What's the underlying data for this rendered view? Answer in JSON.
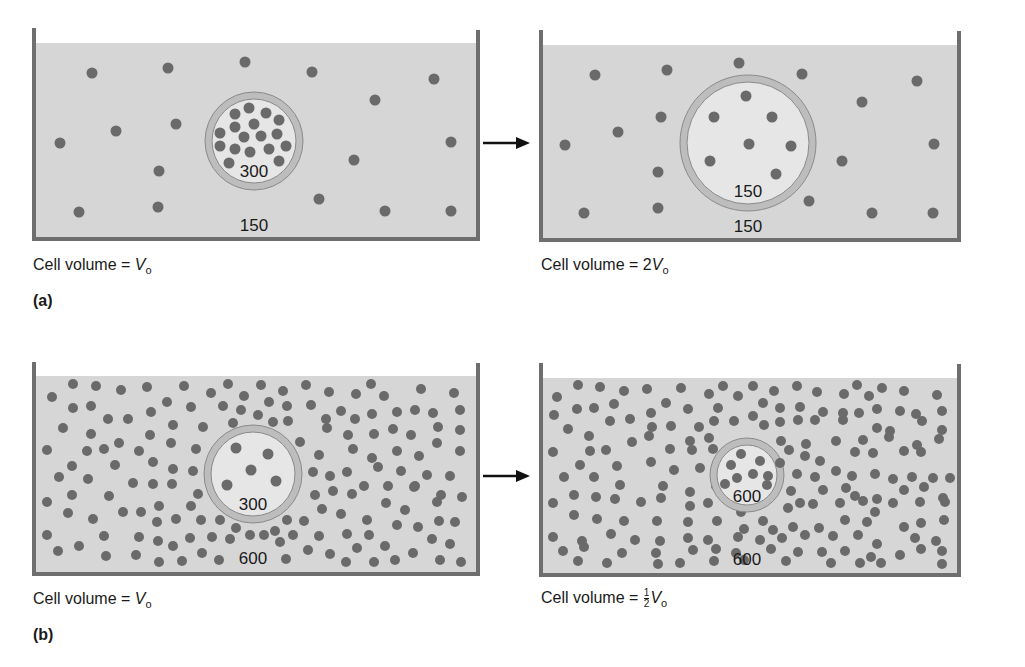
{
  "colors": {
    "fluid": "#d6d6d6",
    "container_wall": "#6e6e6e",
    "particle": "#6a6a6a",
    "cell_interior": "#e6e6e6",
    "cell_membrane": "#bdbdbd",
    "membrane_outline": "#8a8a8a",
    "arrow": "#111111"
  },
  "figure": {
    "panels": [
      {
        "id": "a",
        "label": "(a)",
        "before": {
          "caption_prefix": "Cell volume = ",
          "caption_coeff": "",
          "caption_var": "V",
          "caption_sub": "o",
          "inside_concentration": "300",
          "outside_concentration": "150",
          "cell_radius": 50
        },
        "after": {
          "caption_prefix": "Cell volume = ",
          "caption_coeff": "2",
          "caption_var": "V",
          "caption_sub": "o",
          "inside_concentration": "150",
          "outside_concentration": "150",
          "cell_radius": 70
        }
      },
      {
        "id": "b",
        "label": "(b)",
        "before": {
          "caption_prefix": "Cell volume = ",
          "caption_coeff": "",
          "caption_var": "V",
          "caption_sub": "o",
          "inside_concentration": "300",
          "outside_concentration": "600",
          "cell_radius": 50
        },
        "after": {
          "caption_prefix": "Cell volume = ",
          "caption_frac_num": "1",
          "caption_frac_den": "2",
          "caption_var": "V",
          "caption_sub": "o",
          "inside_concentration": "600",
          "outside_concentration": "600",
          "cell_radius": 38
        }
      }
    ],
    "arrow_icon": "right-arrow"
  }
}
